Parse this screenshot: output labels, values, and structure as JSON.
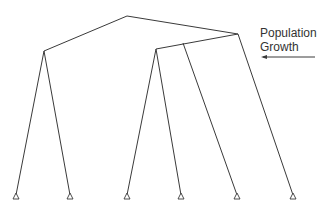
{
  "diagram": {
    "type": "phylogenetic-tree",
    "annotation": {
      "line1": "Population",
      "line2": "Growth",
      "arrow_direction": "left"
    },
    "colors": {
      "line": "#3a3a3a",
      "text": "#333333",
      "background": "#ffffff"
    },
    "nodes": {
      "root": [
        127,
        16
      ],
      "left_internal": [
        44,
        51
      ],
      "right_internal": [
        238,
        34
      ],
      "sub_internal": [
        156,
        49
      ],
      "branch_point": [
        183,
        42
      ]
    },
    "leaves": [
      {
        "x": 16,
        "y": 197
      },
      {
        "x": 70,
        "y": 197
      },
      {
        "x": 127,
        "y": 197
      },
      {
        "x": 181,
        "y": 197
      },
      {
        "x": 237,
        "y": 197
      },
      {
        "x": 293,
        "y": 197
      }
    ],
    "leaf_count": 6
  }
}
